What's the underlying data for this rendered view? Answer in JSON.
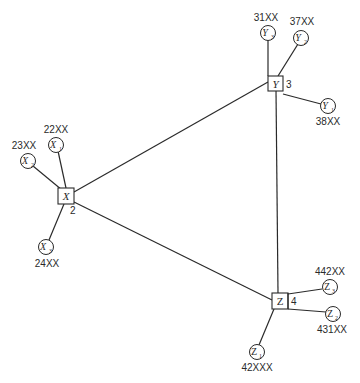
{
  "diagram": {
    "hubs": [
      {
        "id": "X",
        "label": "X",
        "number": "2"
      },
      {
        "id": "Y",
        "label": "Y",
        "number": "3"
      },
      {
        "id": "Z",
        "label": "Z",
        "number": "4"
      }
    ],
    "hub_links": [
      [
        "X",
        "Y"
      ],
      [
        "Y",
        "Z"
      ],
      [
        "X",
        "Z"
      ]
    ],
    "leaves": {
      "X1": {
        "symbol": "X",
        "sub": "1",
        "code": "22XX",
        "parent": "X"
      },
      "X2": {
        "symbol": "X",
        "sub": "2",
        "code": "23XX",
        "parent": "X"
      },
      "X3": {
        "symbol": "X",
        "sub": "3",
        "code": "24XX",
        "parent": "X"
      },
      "Y1": {
        "symbol": "Y",
        "sub": "1",
        "code": "38XX",
        "parent": "Y"
      },
      "Y2": {
        "symbol": "Y",
        "sub": "2",
        "code": "37XX",
        "parent": "Y"
      },
      "Y3": {
        "symbol": "Y",
        "sub": "3",
        "code": "31XX",
        "parent": "Y"
      },
      "Z1": {
        "symbol": "Z",
        "sub": "1",
        "code": "42XXX",
        "parent": "Z"
      },
      "Z2": {
        "symbol": "Z",
        "sub": "2",
        "code": "431XX",
        "parent": "Z"
      },
      "Z3": {
        "symbol": "Z",
        "sub": "3",
        "code": "442XX",
        "parent": "Z"
      }
    },
    "colors": {
      "ink": "#2a2a2a",
      "background": "#ffffff"
    }
  }
}
